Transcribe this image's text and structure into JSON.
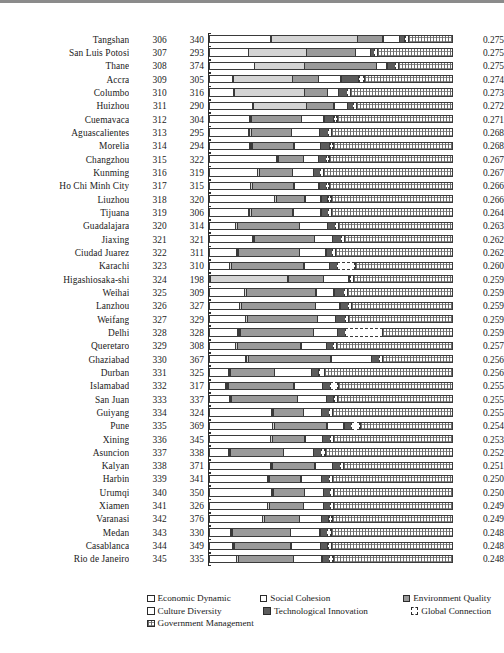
{
  "chart_data": {
    "type": "bar",
    "subtype": "horizontal-stacked-normalized",
    "title": "",
    "xlabel": "",
    "ylabel": "",
    "grid": false,
    "legend_position": "bottom",
    "columns": [
      "City",
      "Rank",
      "Score",
      "Composition",
      "Index"
    ],
    "series": [
      {
        "name": "Economic Dynamic",
        "key": "s0",
        "color": "#ffffff",
        "pattern": "solid-outline"
      },
      {
        "name": "Social Cohesion",
        "key": "s1",
        "color": "#d4d4d4",
        "pattern": "light-gray"
      },
      {
        "name": "Environment Quality",
        "key": "s2",
        "color": "#9a9a9a",
        "pattern": "medium-gray"
      },
      {
        "name": "Culture Diversity",
        "key": "s3",
        "color": "#ffffff",
        "pattern": "solid-outline"
      },
      {
        "name": "Technological Innovation",
        "key": "s4",
        "color": "#5c5c5c",
        "pattern": "dark-gray"
      },
      {
        "name": "Global Connection",
        "key": "s5",
        "color": "#ffffff",
        "pattern": "dashed-outline"
      },
      {
        "name": "Government Management",
        "key": "s6",
        "color": "#6d6d6d",
        "pattern": "hatched"
      }
    ],
    "rows": [
      {
        "city": "Tangshan",
        "rank": "306",
        "score": "340",
        "value": "0.275",
        "segments": [
          25.1,
          35.2,
          10.5,
          7.1,
          2.4,
          1.6,
          18.1
        ]
      },
      {
        "city": "San Luis Potosi",
        "rank": "307",
        "score": "293",
        "value": "0.275",
        "segments": [
          16.0,
          23.8,
          20.0,
          6.2,
          1.9,
          1.6,
          30.5
        ]
      },
      {
        "city": "Thane",
        "rank": "308",
        "score": "374",
        "value": "0.275",
        "segments": [
          18.4,
          20.5,
          29.2,
          4.6,
          3.8,
          1.4,
          22.1
        ]
      },
      {
        "city": "Accra",
        "rank": "309",
        "score": "305",
        "value": "0.274",
        "segments": [
          9.8,
          24.2,
          10.8,
          9.4,
          7.5,
          2.3,
          36.0
        ]
      },
      {
        "city": "Columbo",
        "rank": "310",
        "score": "316",
        "value": "0.273",
        "segments": [
          10.2,
          28.6,
          9.6,
          4.8,
          3.8,
          1.6,
          41.4
        ]
      },
      {
        "city": "Huizhou",
        "rank": "311",
        "score": "290",
        "value": "0.272",
        "segments": [
          17.8,
          22.0,
          11.3,
          5.6,
          2.9,
          1.5,
          38.9
        ]
      },
      {
        "city": "Cuemavaca",
        "rank": "312",
        "score": "304",
        "value": "0.271",
        "segments": [
          16.5,
          0.8,
          20.8,
          9.2,
          4.3,
          1.5,
          46.9
        ]
      },
      {
        "city": "Aguascalientes",
        "rank": "313",
        "score": "295",
        "value": "0.268",
        "segments": [
          16.2,
          1.2,
          16.6,
          11.4,
          3.9,
          1.6,
          49.1
        ]
      },
      {
        "city": "Morelia",
        "rank": "314",
        "score": "294",
        "value": "0.268",
        "segments": [
          16.6,
          1.1,
          17.3,
          10.8,
          4.2,
          1.5,
          48.5
        ]
      },
      {
        "city": "Changzhou",
        "rank": "315",
        "score": "322",
        "value": "0.267",
        "segments": [
          27.3,
          0.9,
          10.6,
          6.2,
          3.5,
          1.4,
          50.1
        ]
      },
      {
        "city": "Kunming",
        "rank": "316",
        "score": "319",
        "value": "0.267",
        "segments": [
          19.8,
          1.0,
          13.5,
          8.7,
          3.3,
          1.5,
          52.2
        ]
      },
      {
        "city": "Ho Chi Minh City",
        "rank": "317",
        "score": "315",
        "value": "0.266",
        "segments": [
          16.8,
          1.1,
          17.0,
          10.4,
          3.2,
          1.4,
          50.1
        ]
      },
      {
        "city": "Liuzhou",
        "rank": "318",
        "score": "320",
        "value": "0.266",
        "segments": [
          26.6,
          1.0,
          11.8,
          6.7,
          3.1,
          1.5,
          49.3
        ]
      },
      {
        "city": "Tijuana",
        "rank": "319",
        "score": "306",
        "value": "0.264",
        "segments": [
          16.3,
          1.2,
          17.1,
          11.5,
          3.4,
          1.5,
          49.0
        ]
      },
      {
        "city": "Guadalajara",
        "rank": "320",
        "score": "314",
        "value": "0.263",
        "segments": [
          10.8,
          1.0,
          25.4,
          11.5,
          3.6,
          1.5,
          46.2
        ]
      },
      {
        "city": "Jiaxing",
        "rank": "321",
        "score": "321",
        "value": "0.262",
        "segments": [
          17.6,
          1.0,
          24.7,
          7.4,
          4.0,
          1.5,
          43.8
        ]
      },
      {
        "city": "Ciudad Juarez",
        "rank": "322",
        "score": "311",
        "value": "0.262",
        "segments": [
          11.1,
          1.0,
          25.2,
          10.8,
          2.9,
          1.4,
          47.6
        ]
      },
      {
        "city": "Karachi",
        "rank": "323",
        "score": "310",
        "value": "0.260",
        "segments": [
          8.4,
          1.0,
          29.6,
          10.6,
          3.4,
          7.4,
          39.6
        ]
      },
      {
        "city": "Higashiosaka-shi",
        "rank": "324",
        "score": "198",
        "value": "0.259",
        "segments": [
          0.6,
          31.4,
          14.6,
          10.6,
          0.9,
          1.5,
          40.4
        ]
      },
      {
        "city": "Weihai",
        "rank": "325",
        "score": "309",
        "value": "0.259",
        "segments": [
          14.5,
          1.1,
          28.2,
          7.6,
          4.4,
          1.5,
          42.7
        ]
      },
      {
        "city": "Lanzhou",
        "rank": "326",
        "score": "327",
        "value": "0.259",
        "segments": [
          12.5,
          1.1,
          29.9,
          10.3,
          3.6,
          1.5,
          41.1
        ]
      },
      {
        "city": "Weifang",
        "rank": "327",
        "score": "329",
        "value": "0.259",
        "segments": [
          14.9,
          1.1,
          28.4,
          7.6,
          4.3,
          1.5,
          42.2
        ]
      },
      {
        "city": "Delhi",
        "rank": "328",
        "score": "328",
        "value": "0.259",
        "segments": [
          11.8,
          1.1,
          30.0,
          9.9,
          3.5,
          15.2,
          28.5
        ]
      },
      {
        "city": "Queretaro",
        "rank": "329",
        "score": "308",
        "value": "0.257",
        "segments": [
          10.8,
          1.0,
          26.0,
          10.5,
          3.0,
          1.5,
          47.2
        ]
      },
      {
        "city": "Ghaziabad",
        "rank": "330",
        "score": "367",
        "value": "0.256",
        "segments": [
          15.0,
          1.2,
          33.7,
          16.5,
          3.7,
          1.3,
          28.6
        ]
      },
      {
        "city": "Durban",
        "rank": "331",
        "score": "325",
        "value": "0.256",
        "segments": [
          8.2,
          1.0,
          18.0,
          15.2,
          3.2,
          2.4,
          52.0
        ]
      },
      {
        "city": "Islamabad",
        "rank": "332",
        "score": "317",
        "value": "0.255",
        "segments": [
          7.0,
          1.0,
          26.9,
          11.9,
          3.5,
          3.2,
          46.5
        ]
      },
      {
        "city": "San Juan",
        "rank": "333",
        "score": "337",
        "value": "0.255",
        "segments": [
          8.3,
          1.0,
          27.0,
          12.0,
          3.4,
          1.6,
          46.7
        ]
      },
      {
        "city": "Guiyang",
        "rank": "334",
        "score": "324",
        "value": "0.255",
        "segments": [
          25.2,
          1.0,
          12.5,
          7.6,
          3.4,
          1.5,
          48.8
        ]
      },
      {
        "city": "Pune",
        "rank": "335",
        "score": "369",
        "value": "0.254",
        "segments": [
          25.6,
          1.1,
          21.5,
          7.2,
          3.4,
          3.6,
          37.6
        ]
      },
      {
        "city": "Xining",
        "rank": "336",
        "score": "345",
        "value": "0.253",
        "segments": [
          25.0,
          1.0,
          13.4,
          7.4,
          3.5,
          1.5,
          48.2
        ]
      },
      {
        "city": "Asuncion",
        "rank": "337",
        "score": "338",
        "value": "0.252",
        "segments": [
          8.2,
          1.0,
          21.6,
          12.4,
          3.5,
          1.6,
          51.7
        ]
      },
      {
        "city": "Kalyan",
        "rank": "338",
        "score": "371",
        "value": "0.251",
        "segments": [
          24.8,
          1.0,
          17.6,
          7.4,
          3.4,
          1.5,
          44.3
        ]
      },
      {
        "city": "Harbin",
        "rank": "339",
        "score": "341",
        "value": "0.250",
        "segments": [
          23.6,
          1.0,
          13.2,
          8.5,
          3.4,
          1.5,
          48.8
        ]
      },
      {
        "city": "Urumqi",
        "rank": "340",
        "score": "350",
        "value": "0.250",
        "segments": [
          25.2,
          1.0,
          13.0,
          7.8,
          3.3,
          1.5,
          48.2
        ]
      },
      {
        "city": "Xiamen",
        "rank": "341",
        "score": "326",
        "value": "0.249",
        "segments": [
          23.8,
          1.0,
          14.0,
          8.2,
          3.3,
          1.5,
          48.2
        ]
      },
      {
        "city": "Varanasi",
        "rank": "342",
        "score": "376",
        "value": "0.249",
        "segments": [
          21.8,
          1.0,
          14.4,
          9.0,
          3.4,
          1.5,
          48.9
        ]
      },
      {
        "city": "Medan",
        "rank": "343",
        "score": "330",
        "value": "0.248",
        "segments": [
          9.0,
          1.0,
          23.5,
          12.2,
          3.4,
          1.6,
          49.3
        ]
      },
      {
        "city": "Casablanca",
        "rank": "344",
        "score": "349",
        "value": "0.248",
        "segments": [
          9.8,
          1.0,
          23.0,
          12.0,
          3.4,
          1.6,
          49.2
        ]
      },
      {
        "city": "Rio de Janeiro",
        "rank": "345",
        "score": "335",
        "value": "0.248",
        "segments": [
          11.2,
          1.0,
          22.5,
          11.8,
          3.4,
          1.6,
          48.5
        ]
      }
    ]
  },
  "legend": {
    "items": [
      {
        "label": "Economic Dynamic",
        "swatch": "k0"
      },
      {
        "label": "Social Cohesion",
        "swatch": "k1"
      },
      {
        "label": "Environment Quality",
        "swatch": "k2"
      },
      {
        "label": "Culture Diversity",
        "swatch": "k3"
      },
      {
        "label": "Technological Innovation",
        "swatch": "k4"
      },
      {
        "label": "Global Connection",
        "swatch": "k5"
      },
      {
        "label": "Government Management",
        "swatch": "k6"
      }
    ]
  }
}
